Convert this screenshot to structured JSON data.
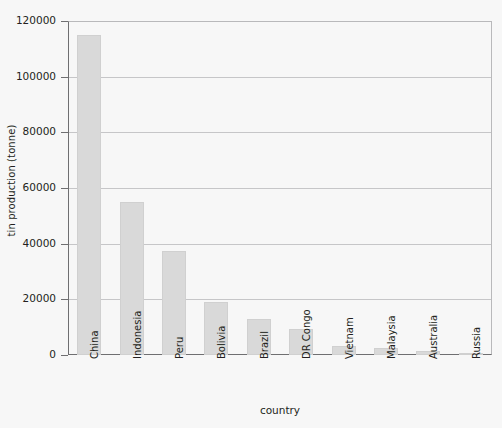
{
  "chart_data": {
    "type": "bar",
    "title": "",
    "subtitle": "",
    "xlabel": "country",
    "ylabel": "tin production (tonne)",
    "categories": [
      "China",
      "Indonesia",
      "Peru",
      "Bolivia",
      "Brazil",
      "DR Congo",
      "Vietnam",
      "Malaysia",
      "Australia",
      "Russia"
    ],
    "values": [
      115000,
      55000,
      37500,
      19000,
      13000,
      9200,
      3300,
      2400,
      1300,
      800
    ],
    "series": [
      {
        "name": "tin production",
        "values": [
          115000,
          55000,
          37500,
          19000,
          13000,
          9200,
          3300,
          2400,
          1300,
          800
        ]
      }
    ],
    "ylim": [
      0,
      120000
    ],
    "ytick_values": [
      0,
      20000,
      40000,
      60000,
      80000,
      100000,
      120000
    ],
    "ytick_labels": [
      "0",
      "20000",
      "40000",
      "60000",
      "80000",
      "100000",
      "120000"
    ],
    "grid": true,
    "grid_axis": "y",
    "legend": false,
    "legend_position": "none",
    "bar_color": "#d9d9d9",
    "background_color": "#f7f7f7",
    "axis_color": "#6f6f71",
    "grid_color": "#c6c6c8",
    "annotations": []
  }
}
